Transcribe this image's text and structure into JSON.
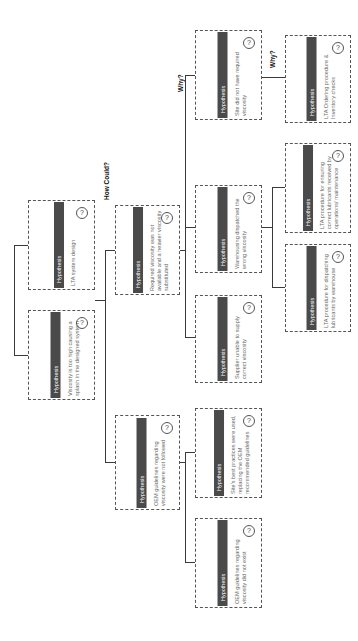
{
  "header_label": "Hypothesis",
  "question_icon": "?",
  "labels": {
    "how_could": "How Could?",
    "why_1": "Why?",
    "why_2": "Why?"
  },
  "boxes": {
    "lta_system_design": {
      "header": "Hypothesis",
      "text": "LTA system design"
    },
    "viscosity_too_high": {
      "header": "Hypothesis",
      "text": "Viscosity is too high causing a splash in the designed system"
    },
    "required_not_available": {
      "header": "Hypothesis",
      "text": "Required viscosity was not available and a heavier viscosity substituted"
    },
    "oem_not_followed": {
      "header": "Hypothesis",
      "text": "OEM guidelines regarding viscosity were not followed"
    },
    "site_no_viscosity": {
      "header": "Hypothesis",
      "text": "Site did not have required viscosity"
    },
    "warehousing_wrong": {
      "header": "Hypothesis",
      "text": "Warehousing dispatched the wrong viscosity"
    },
    "supplier_unable": {
      "header": "Hypothesis",
      "text": "Supplier unable to supply correct viscosity"
    },
    "site_best_practices": {
      "header": "Hypothesis",
      "text": "Site's best practices were used, replacing the OEM recommended guidelines"
    },
    "oem_not_exist": {
      "header": "Hypothesis",
      "text": "OEM guidelines regarding viscosity did not exist"
    },
    "lta_ordering": {
      "header": "Hypothesis",
      "text": "LTA Ordering procedure & Inventory checks"
    },
    "lta_ensuring": {
      "header": "Hypothesis",
      "text": "LTA procedure for ensuring correct lubricants received by operations/ maintenance"
    },
    "lta_dispatching": {
      "header": "Hypothesis",
      "text": "LTA procedure for dispatching lubricants by warehouse"
    }
  }
}
